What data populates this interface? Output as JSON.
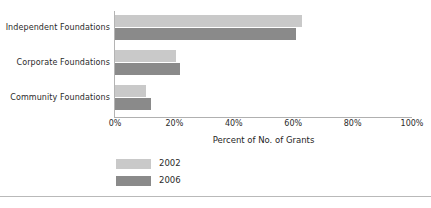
{
  "chart_data": {
    "type": "bar",
    "orientation": "horizontal",
    "title": "",
    "xlabel": "Percent of No. of Grants",
    "ylabel": "",
    "xlim": [
      0,
      100
    ],
    "xticks": [
      "0%",
      "20%",
      "40%",
      "60%",
      "80%",
      "100%"
    ],
    "xtick_values": [
      0,
      20,
      40,
      60,
      80,
      100
    ],
    "grid": false,
    "legend_position": "bottom-left",
    "categories": [
      "Independent Foundations",
      "Corporate Foundations",
      "Community Foundations"
    ],
    "series": [
      {
        "name": "2002",
        "color": "#c9c9c9",
        "values": [
          63,
          20.5,
          10.5
        ]
      },
      {
        "name": "2006",
        "color": "#8a8a8a",
        "values": [
          61,
          22,
          12
        ]
      }
    ]
  },
  "legend": {
    "items": [
      {
        "label": "2002"
      },
      {
        "label": "2006"
      }
    ]
  },
  "colors": {
    "series_2002": "#c9c9c9",
    "series_2006": "#8a8a8a",
    "axis": "#b0b0b0",
    "text": "#2b2b2b",
    "rule": "#b9b9b9",
    "background": "#ffffff"
  }
}
